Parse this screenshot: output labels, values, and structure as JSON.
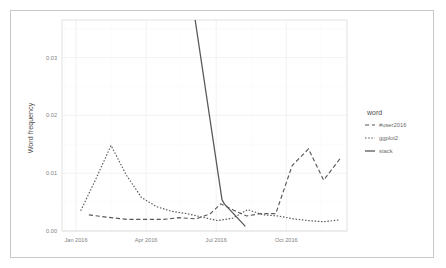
{
  "figure": {
    "background_color": "#ffffff",
    "border_color": "#c8c8c8",
    "panel_border_color": "#d9d9d9",
    "grid_color": "#ededed"
  },
  "legend": {
    "title": "word",
    "position": "right",
    "entries": [
      {
        "label": "#user2016",
        "style": "dashed",
        "color": "#595959"
      },
      {
        "label": "ggplot2",
        "style": "dotted",
        "color": "#595959"
      },
      {
        "label": "stack",
        "style": "solid",
        "color": "#595959"
      }
    ]
  },
  "axes": {
    "y_label": "Word frequency",
    "y_ticks": [
      "0.00",
      "0.01",
      "0.02",
      "0.03"
    ],
    "y_tick_values": [
      0.0,
      0.01,
      0.02,
      0.03
    ],
    "x_ticks": [
      "Jan 2016",
      "Apr 2016",
      "Jul 2016",
      "Oct 2016"
    ],
    "x_tick_values": [
      0,
      3,
      6,
      9
    ]
  },
  "chart_data": {
    "type": "line",
    "title": "",
    "xlabel": "",
    "ylabel": "Word frequency",
    "xlim": [
      -0.6,
      11.6
    ],
    "ylim": [
      0.0,
      0.0365
    ],
    "grid": true,
    "legend_position": "right",
    "legend_title": "word",
    "x": [
      0,
      1,
      2,
      3,
      4,
      5,
      6,
      7,
      8,
      9,
      10,
      11
    ],
    "x_labels": [
      "Jan 2016",
      "Feb 2016",
      "Mar 2016",
      "Apr 2016",
      "May 2016",
      "Jun 2016",
      "Jul 2016",
      "Aug 2016",
      "Sep 2016",
      "Oct 2016",
      "Nov 2016",
      "Dec 2016"
    ],
    "series": [
      {
        "name": "#user2016",
        "style": "dashed",
        "color": "#595959",
        "x": [
          0.55,
          1.3,
          2.2,
          3.1,
          3.75,
          4.4,
          5.15,
          5.75,
          6.2,
          6.75,
          7.3,
          7.9,
          8.55,
          9.25,
          9.95,
          10.6,
          11.3
        ],
        "values": [
          0.0028,
          0.0024,
          0.002,
          0.002,
          0.002,
          0.0023,
          0.0021,
          0.003,
          0.0047,
          0.0036,
          0.0026,
          0.003,
          0.003,
          0.0113,
          0.0142,
          0.0088,
          0.0125
        ]
      },
      {
        "name": "ggplot2",
        "style": "dotted",
        "color": "#595959",
        "x": [
          0.2,
          0.85,
          1.5,
          2.15,
          2.8,
          3.45,
          4.1,
          4.75,
          5.4,
          6.05,
          6.7,
          7.35,
          8.0,
          8.65,
          9.3,
          9.95,
          10.6,
          11.25
        ],
        "values": [
          0.0035,
          0.009,
          0.0148,
          0.0097,
          0.0058,
          0.0042,
          0.0034,
          0.003,
          0.0024,
          0.0018,
          0.0022,
          0.0037,
          0.0028,
          0.0026,
          0.0021,
          0.0018,
          0.0016,
          0.0019
        ]
      },
      {
        "name": "stack",
        "style": "solid",
        "color": "#595959",
        "x": [
          5.1,
          6.25,
          6.35,
          7.25
        ],
        "values": [
          0.0365,
          0.0054,
          0.0047,
          0.0008
        ]
      }
    ]
  }
}
